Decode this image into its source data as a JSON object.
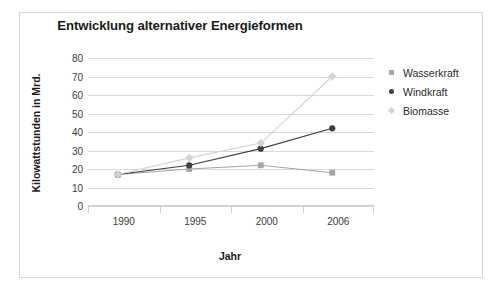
{
  "figure": {
    "background_color": "#ffffff",
    "border_color": "#d6d6d6"
  },
  "chart_data": {
    "type": "line",
    "title": "Entwicklung alternativer Energieformen",
    "xlabel": "Jahr",
    "ylabel": "Kilowattstunden in Mrd.",
    "x": [
      1989,
      1994,
      1999,
      2004
    ],
    "categories": [
      "1990",
      "1995",
      "2000",
      "2006"
    ],
    "xtick_labels": [
      "1990",
      "1995",
      "2000",
      "2006"
    ],
    "ytick_labels": [
      "80",
      "70",
      "60",
      "50",
      "40",
      "30",
      "20",
      "10",
      "0"
    ],
    "ylim": [
      0,
      80
    ],
    "ytick_step": 10,
    "grid": "horizontal",
    "legend_position": "right",
    "series": [
      {
        "name": "Wasserkraft",
        "marker": "square",
        "color": "#a6a6a6",
        "values": [
          17,
          20,
          22,
          18
        ]
      },
      {
        "name": "Windkraft",
        "marker": "circle",
        "color": "#3f3f3f",
        "values": [
          17,
          22,
          31,
          42
        ]
      },
      {
        "name": "Biomasse",
        "marker": "diamond",
        "color": "#d2d2d2",
        "values": [
          17,
          26,
          34,
          70
        ]
      }
    ]
  },
  "legend": {
    "items": [
      {
        "label": "Wasserkraft",
        "marker": "square-marker",
        "color": "#a6a6a6"
      },
      {
        "label": "Windkraft",
        "marker": "circle-marker",
        "color": "#3f3f3f"
      },
      {
        "label": "Biomasse",
        "marker": "diamond-marker",
        "color": "#d2d2d2"
      }
    ]
  }
}
